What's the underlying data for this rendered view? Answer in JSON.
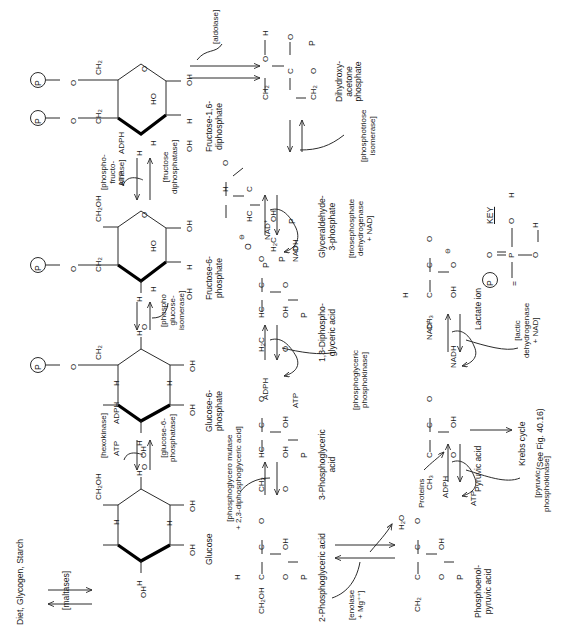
{
  "figure": {
    "orientation": "rotated-90-ccw",
    "ink_color": "#2b2b2b",
    "paper_color": "#ffffff"
  },
  "sources": {
    "diet": "Diet, Glycogen, Starch",
    "proteins": "Proteins"
  },
  "metabolites": {
    "glucose": "Glucose",
    "glucose6p": "Glucose-6-\nphosphate",
    "fructose6p": "Fructose-6-\nphosphate",
    "fructose16dp": "Fructose-1,6-\ndiphosphate",
    "dhap": "Dihydroxy-\nacetone\nphosphate",
    "g3p": "Glyceraldehyde-\n3-phosphate",
    "dpga": "1,3-Diphospho-\nglyceric acid",
    "pga3": "3-Phosphoglyceric\nacid",
    "pga2": "2-Phosphoglyceric acid",
    "pep": "Phosphoenol-\npyruvic acid",
    "pyruvate": "Pyruvic acid",
    "lactate": "Lactate ion"
  },
  "enzymes": {
    "maltases": "[maltases]",
    "hexokinase": "[hexokinase]",
    "glucose6phosphatase": "[glucose-6-\nphosphatase]",
    "phosphoglucoisomerase": "[phospho\nglucose-\nisomerase]",
    "phosphofructokinase": "[phospho-\nfructo-\nkinase]",
    "fructosediphosphatase": "[fructose\ndiphosphatase]",
    "aldolase": "[aldolase]",
    "phosphotrioseisomerase": "[phosphotriose\nisomerase]",
    "triosephosphatedehydrogenase": "[triosephosphate\ndehydrogenase\n+ NAD]",
    "phosphoglycericphosphokinase": "[phosphoglyceric\nphosphokinase]",
    "phosphoglyceromutase": "[phosphoglycero mutase\n+ 2,3-diphosphoglyceric acid]",
    "enolase": "[enolase\n+ Mg⁺⁺]",
    "pyruvicphosphokinase": "[pyruvic\nphosphokinase]",
    "lacticdehydrogenase": "[lactic\ndehydrogenase + NAD]"
  },
  "cofactors": {
    "atp": "ATP",
    "adph": "ADPH",
    "nad": "NAD",
    "nadh": "NADH",
    "water": "H",
    "water_sub": "2",
    "water_tail": "O"
  },
  "outputs": {
    "krebs_line1": "Krebs cycle",
    "krebs_line2": "(See Fig. 40.16)"
  },
  "key": {
    "title": "KEY",
    "circle_p": "P",
    "equals": "=",
    "atoms": {
      "O": "O",
      "H": "H",
      "P": "P"
    }
  },
  "atoms": {
    "C": "C",
    "H": "H",
    "O": "O",
    "OH": "OH",
    "HO": "HO",
    "CH2OH": "CH2OH",
    "CH2": "CH2",
    "CH3": "CH3",
    "H2C": "H2C",
    "HC": "HC",
    "P": "P",
    "neg": "⊖"
  }
}
